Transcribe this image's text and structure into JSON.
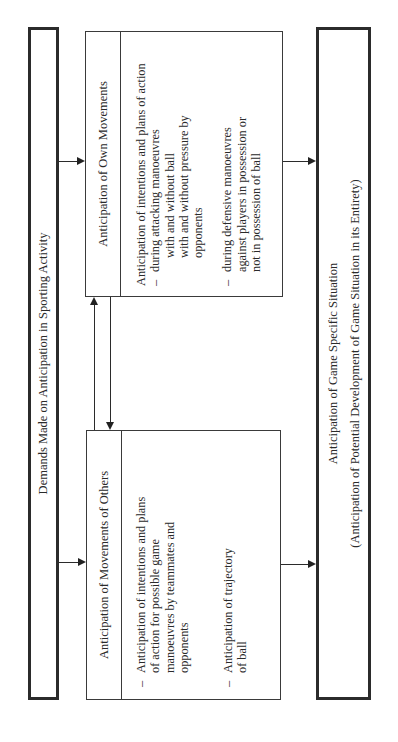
{
  "diagram": {
    "orientation": "rotated-90-ccw",
    "top_box": {
      "label": "Demands Made on Anticipation in Sporting Activity"
    },
    "others_box": {
      "title": "Anticipation of Movements of Others",
      "items": [
        {
          "bullet": "–",
          "lines": [
            "Anticipation of intentions and plans",
            "of action for possible game",
            "manoeuvres by teammates and",
            "opponents"
          ]
        },
        {
          "bullet": "–",
          "lines": [
            "Anticipation of trajectory",
            "of ball"
          ]
        }
      ]
    },
    "own_box": {
      "title": "Anticipation of Own Movements",
      "intro": "Anticipation of intentions and plans of action",
      "items": [
        {
          "bullet": "–",
          "lines": [
            "during attacking manoeuvres"
          ],
          "sub_lines": [
            "with and without ball",
            "with and without pressure by",
            "opponents"
          ]
        },
        {
          "bullet": "–",
          "lines": [
            "during defensive manoeuvres",
            "against players in possession or",
            "not in possession of ball"
          ]
        }
      ]
    },
    "bottom_box": {
      "line1": "Anticipation of Game Specific Situation",
      "line2": "(Anticipation of Potential Development of Game Situation in its Entirety)"
    },
    "connectors": [
      {
        "from": "top_box",
        "to": "others_box",
        "type": "arrow"
      },
      {
        "from": "top_box",
        "to": "own_box",
        "type": "arrow"
      },
      {
        "from": "others_box",
        "to": "own_box",
        "type": "arrow"
      },
      {
        "from": "own_box",
        "to": "others_box",
        "type": "arrow"
      },
      {
        "from": "others_box",
        "to": "bottom_box",
        "type": "arrow"
      },
      {
        "from": "own_box",
        "to": "bottom_box",
        "type": "arrow"
      }
    ]
  }
}
